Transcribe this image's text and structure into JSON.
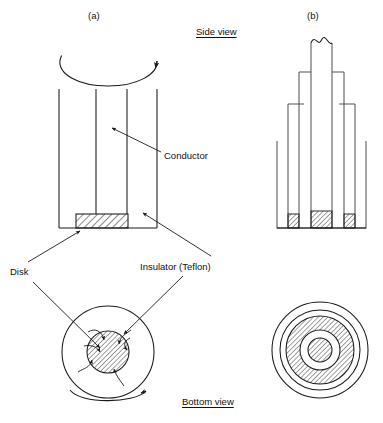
{
  "figure": {
    "panels": [
      {
        "id": "a",
        "label": "(a)"
      },
      {
        "id": "b",
        "label": "(b)"
      }
    ],
    "headings": {
      "side_view": "Side view",
      "bottom_view": "Bottom view"
    },
    "callouts": [
      {
        "id": "conductor",
        "text": "Conductor"
      },
      {
        "id": "insulator",
        "text": "Insulator (Teflon)"
      },
      {
        "id": "disk",
        "text": "Disk"
      }
    ],
    "colors": {
      "stroke": "#1a1a1a",
      "stroke_light": "#555555",
      "hatch": "#2b2b2b",
      "background": "#ffffff"
    }
  }
}
